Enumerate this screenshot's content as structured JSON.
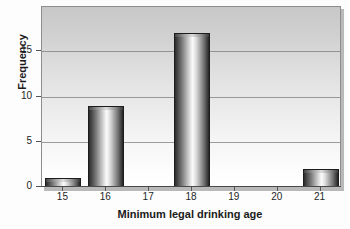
{
  "chart_data": {
    "type": "bar",
    "title": "",
    "xlabel": "Minimum legal drinking age",
    "ylabel": "Frequency",
    "categories": [
      "15",
      "16",
      "17",
      "18",
      "19",
      "20",
      "21"
    ],
    "values": [
      1,
      9,
      0,
      17,
      0,
      0,
      2
    ],
    "xtick_labels": [
      "15",
      "16",
      "17",
      "18",
      "19",
      "20",
      "21"
    ],
    "ytick_labels": [
      "0",
      "5",
      "10",
      "15"
    ],
    "ytick_values": [
      0,
      5,
      10,
      15
    ],
    "ylim": [
      0,
      19.9
    ],
    "xlim": [
      14.5,
      21.5
    ],
    "grid": "horizontal",
    "legend": "none",
    "bar_style": "cylindrical-gradient",
    "colors": {
      "bar_dark": "#232323",
      "bar_light": "#fbfbfb",
      "grid": "#7e7e7e",
      "frame": "#8d8d8d",
      "text": "#1a1a1a",
      "plot_bg_top": "#c8c8c8",
      "plot_bg_bottom": "#ffffff"
    }
  }
}
